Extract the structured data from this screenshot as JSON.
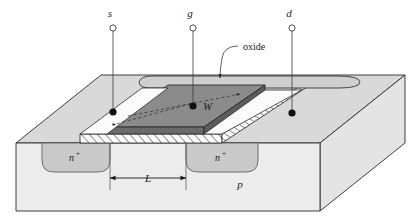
{
  "figure": {
    "type": "semiconductor-device-cross-section"
  },
  "terminals": [
    {
      "id": "source",
      "label": "s",
      "x": 113,
      "y": 18
    },
    {
      "id": "gate",
      "label": "g",
      "x": 193,
      "y": 18
    },
    {
      "id": "drain",
      "label": "d",
      "x": 292,
      "y": 18
    }
  ],
  "annotations": {
    "oxide_label": "oxide",
    "width_label": "W",
    "length_label": "L",
    "substrate_label": "p",
    "source_region_label": "n",
    "source_region_sup": "+",
    "drain_region_label": "n",
    "drain_region_sup": "+"
  },
  "colors": {
    "background": "#ffffff",
    "outline": "#2b2b2b",
    "substrate_front": "#ebebeb",
    "substrate_top": "#d8d8d8",
    "substrate_right": "#e2e2e2",
    "nplus_region": "#c9c9c9",
    "gate_top": "#8e8e8e",
    "gate_front": "#6e6e6e",
    "gate_side": "#5e5e5e",
    "oxide_fill": "#ffffff",
    "oxide_hatch": "#2b2b2b",
    "contact_dot": "#111111",
    "label_text": "#1a1a1a"
  }
}
